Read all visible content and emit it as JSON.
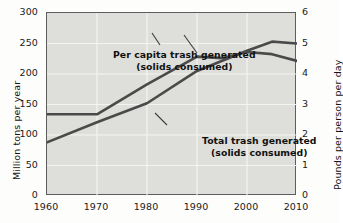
{
  "chart_data": {
    "type": "line",
    "title": "",
    "xlabel": "",
    "ylabel": "Million tons per year",
    "y2label": "Pounds per person per day",
    "xlim": [
      1960,
      2010
    ],
    "ylim": [
      0,
      300
    ],
    "y2lim": [
      0,
      6
    ],
    "grid": true,
    "legend": "inline-annotations",
    "x_ticks": [
      "1960",
      "1970",
      "1980",
      "1990",
      "2000",
      "2010"
    ],
    "x_tick_values": [
      1960,
      1970,
      1980,
      1990,
      2000,
      2010
    ],
    "y_ticks": [
      "0",
      "50",
      "100",
      "150",
      "200",
      "250",
      "300"
    ],
    "y_tick_values": [
      0,
      50,
      100,
      150,
      200,
      250,
      300
    ],
    "y2_ticks": [
      "0",
      "1",
      "2",
      "3",
      "4",
      "5",
      "6"
    ],
    "y2_tick_values": [
      0,
      1,
      2,
      3,
      4,
      5,
      6
    ],
    "series": [
      {
        "name": "Total trash generated (solids consumed)",
        "axis": "left",
        "units": "Million tons per year",
        "color": "#4a4a4a",
        "x": [
          1960,
          1970,
          1980,
          1990,
          2000,
          2005,
          2010
        ],
        "values": [
          88,
          121,
          152,
          205,
          238,
          253,
          250
        ]
      },
      {
        "name": "Per capita trash generated (solids consumed)",
        "axis": "right",
        "units": "Pounds per person per day",
        "color": "#4a4a4a",
        "x": [
          1960,
          1970,
          1980,
          1990,
          1995,
          2000,
          2005,
          2010
        ],
        "values": [
          2.68,
          2.68,
          3.66,
          4.57,
          4.52,
          4.72,
          4.65,
          4.43
        ]
      }
    ],
    "annotations": [
      {
        "id": "per-capita",
        "line1": "Per capita trash generated",
        "line2": "(solids consumed)",
        "points_to_series": "Per capita trash generated (solids consumed)"
      },
      {
        "id": "total",
        "line1": "Total trash generated",
        "line2": "(solids consumed)",
        "points_to_series": "Total trash generated (solids consumed)"
      }
    ]
  },
  "axes": {
    "left_title": "Million tons per year",
    "right_title": "Pounds per person per day"
  },
  "colors": {
    "plot_background": "#dededa",
    "grid": "#f4f4f2",
    "frame": "#5d5d5d",
    "line": "#4a4a4a",
    "text": "#141414"
  }
}
